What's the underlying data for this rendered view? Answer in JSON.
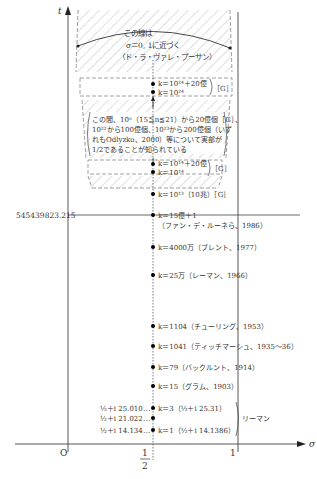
{
  "figure": {
    "axes": {
      "t_label": "t",
      "sigma_label": "σ",
      "origin_label": "O",
      "half_label_num": "1",
      "half_label_den": "2",
      "one_label": "1",
      "t_marker_value": "545439823.215"
    },
    "top_note": {
      "line1": "この線は",
      "line2": "σ＝0, 1に近づく",
      "line3": "（ド・ラ・ヴァレ・プーサン）"
    },
    "middle_note": {
      "line1": "この間、10ⁿ（15≦n≦21）から20億個［G］、",
      "line2": "10²²から100億個、10²³から200億個（いず",
      "line3": "れもOdlyzko、2000）等について実部が",
      "line4": "1/2であることが知られている"
    },
    "zero_labels": [
      {
        "text": "k＝10²⁴＋20億",
        "group": "G1"
      },
      {
        "text": "k＝10²⁴",
        "group": "G1"
      },
      {
        "text": "k＝10¹⁴＋20億",
        "group": "G2"
      },
      {
        "text": "k＝10¹⁴",
        "group": "G2"
      },
      {
        "text": "k＝10¹³（10兆）［G］"
      },
      {
        "text": "k＝15億＋1"
      },
      {
        "text": "（ファン・デ・ルーネら、1986）"
      },
      {
        "text": "k＝4000万（ブレント、1977）"
      },
      {
        "text": "k＝25万（レーマン、1966）"
      },
      {
        "text": "k＝1104（チューリング、1953）"
      },
      {
        "text": "k＝1041（ティッチマーシュ、1935〜36）"
      },
      {
        "text": "k＝79（バックルント、1914）"
      },
      {
        "text": "k＝15（グラム、1903）"
      },
      {
        "text": "k＝3（½＋i 25.31）"
      },
      {
        "text": "k＝1（½＋i 14.1386）"
      }
    ],
    "group_tag": "［G］",
    "riemann_label": "リーマン",
    "first_zeros": [
      {
        "text": "½＋i 25.010⋯"
      },
      {
        "text": "½＋i 21.022⋯"
      },
      {
        "text": "½＋i 14.134⋯"
      }
    ]
  }
}
